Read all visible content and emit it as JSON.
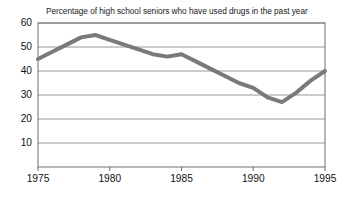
{
  "chart_data": {
    "type": "line",
    "title": "Percentage of high school seniors who have used drugs in the past year",
    "xlabel": "",
    "ylabel": "",
    "xlim": [
      1975,
      1995
    ],
    "ylim": [
      0,
      60
    ],
    "grid": true,
    "grid_axis": "y",
    "legend": "none",
    "series_color": "#7a7a7a",
    "line_width_px": 4,
    "yticks": [
      60,
      50,
      40,
      30,
      20,
      10
    ],
    "xticks": [
      1975,
      1980,
      1985,
      1990,
      1995
    ],
    "ytick_labels": [
      "60",
      "50",
      "40",
      "30",
      "20",
      "10"
    ],
    "xtick_labels": [
      "1975",
      "1980",
      "1985",
      "1990",
      "1995"
    ],
    "series": [
      {
        "name": "Percentage of high school seniors who have used drugs in the past year",
        "x": [
          1975,
          1976,
          1977,
          1978,
          1979,
          1980,
          1981,
          1982,
          1983,
          1984,
          1985,
          1986,
          1987,
          1988,
          1989,
          1990,
          1991,
          1992,
          1993,
          1994,
          1995
        ],
        "values": [
          45,
          48,
          51,
          54,
          55,
          53,
          51,
          49,
          47,
          46,
          47,
          44,
          41,
          38,
          35,
          33,
          29,
          27,
          31,
          36,
          40
        ]
      }
    ]
  }
}
